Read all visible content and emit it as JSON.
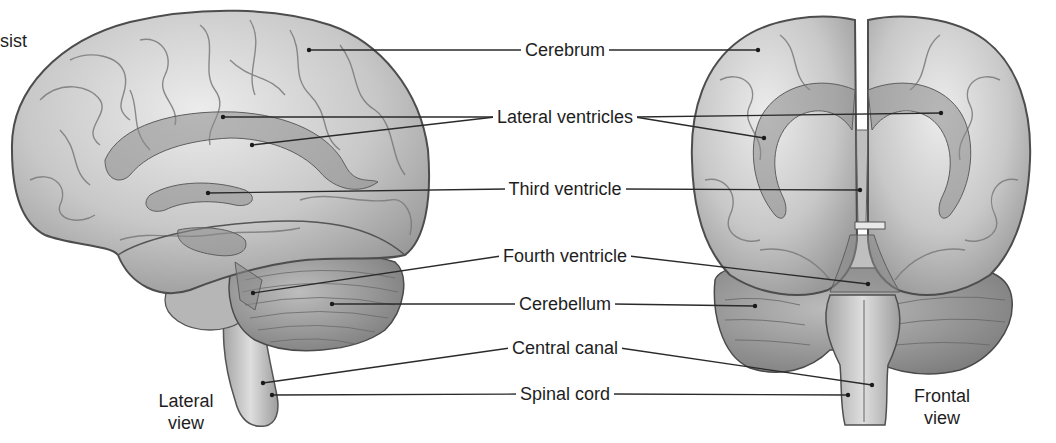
{
  "diagram": {
    "title_fragment": "sist",
    "views": [
      {
        "id": "lateral",
        "caption_line1": "Lateral",
        "caption_line2": "view"
      },
      {
        "id": "frontal",
        "caption_line1": "Frontal",
        "caption_line2": "view"
      }
    ],
    "labels": [
      {
        "id": "cerebrum",
        "text": "Cerebrum",
        "y": 50,
        "left_targets": [
          [
            309,
            50
          ]
        ],
        "right_targets": [
          [
            758,
            50
          ]
        ]
      },
      {
        "id": "lateral-ventricles",
        "text": "Lateral ventricles",
        "y": 117,
        "left_targets": [
          [
            223,
            117
          ],
          [
            252,
            145
          ]
        ],
        "right_targets": [
          [
            941,
            113
          ],
          [
            764,
            138
          ]
        ]
      },
      {
        "id": "third-ventricle",
        "text": "Third ventricle",
        "y": 189,
        "left_targets": [
          [
            208,
            193
          ]
        ],
        "right_targets": [
          [
            860,
            190
          ]
        ]
      },
      {
        "id": "fourth-ventricle",
        "text": "Fourth ventricle",
        "y": 256,
        "left_targets": [
          [
            253,
            293
          ]
        ],
        "right_targets": [
          [
            868,
            284
          ]
        ]
      },
      {
        "id": "cerebellum",
        "text": "Cerebellum",
        "y": 304,
        "left_targets": [
          [
            332,
            304
          ]
        ],
        "right_targets": [
          [
            755,
            306
          ]
        ]
      },
      {
        "id": "central-canal",
        "text": "Central canal",
        "y": 348,
        "left_targets": [
          [
            263,
            383
          ]
        ],
        "right_targets": [
          [
            872,
            385
          ]
        ]
      },
      {
        "id": "spinal-cord",
        "text": "Spinal cord",
        "y": 394,
        "left_targets": [
          [
            272,
            395
          ]
        ],
        "right_targets": [
          [
            848,
            395
          ]
        ]
      }
    ],
    "colors": {
      "brain_fill": "#c9c9c9",
      "brain_light": "#e4e4e4",
      "brain_outline": "#5a5a5a",
      "ventricle_fill": "#8f8f8f",
      "cerebellum_fill": "#a8a8a8",
      "leader_line": "#2a2a2a"
    }
  }
}
